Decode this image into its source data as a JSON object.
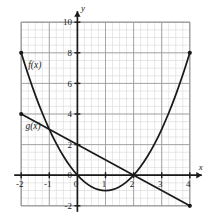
{
  "chart_data": {
    "type": "line",
    "title": "",
    "xlabel": "x",
    "ylabel": "y",
    "xlim": [
      -2,
      4
    ],
    "ylim": [
      -2,
      10
    ],
    "grid": true,
    "grid_minor_x_step": 0.25,
    "grid_minor_y_step": 0.5,
    "x_ticks": [
      -2,
      -1,
      0,
      1,
      2,
      3,
      4
    ],
    "x_tick_labels": [
      "-2",
      "-1",
      "0",
      "1",
      "2",
      "3",
      "4"
    ],
    "y_ticks": [
      -2,
      0,
      2,
      4,
      6,
      8,
      10
    ],
    "y_tick_labels": [
      "-2",
      "0",
      "2",
      "4",
      "6",
      "8",
      "10"
    ],
    "legend_position": "inline-annotation",
    "series": [
      {
        "name": "f(x)",
        "label": "f(x)",
        "equation": "x^2 - 2x",
        "shape": "parabola",
        "color": "#1a1a1a",
        "vertex": [
          1,
          -1
        ],
        "endpoints": [
          [
            -2,
            8
          ],
          [
            4,
            8
          ]
        ],
        "endpoint_markers": true,
        "label_position": [
          -1.75,
          7.0
        ],
        "points": [
          [
            -2,
            8
          ],
          [
            -1.75,
            6.5625
          ],
          [
            -1.5,
            5.25
          ],
          [
            -1.25,
            4.0625
          ],
          [
            -1,
            3
          ],
          [
            -0.75,
            2.0625
          ],
          [
            -0.5,
            1.25
          ],
          [
            -0.25,
            0.5625
          ],
          [
            0,
            0
          ],
          [
            0.25,
            -0.4375
          ],
          [
            0.5,
            -0.75
          ],
          [
            0.75,
            -0.9375
          ],
          [
            1,
            -1
          ],
          [
            1.25,
            -0.9375
          ],
          [
            1.5,
            -0.75
          ],
          [
            1.75,
            -0.4375
          ],
          [
            2,
            0
          ],
          [
            2.25,
            0.5625
          ],
          [
            2.5,
            1.25
          ],
          [
            2.75,
            2.0625
          ],
          [
            3,
            3
          ],
          [
            3.25,
            4.0625
          ],
          [
            3.5,
            5.25
          ],
          [
            3.75,
            6.5625
          ],
          [
            4,
            8
          ]
        ]
      },
      {
        "name": "g(x)",
        "label": "g(x)",
        "equation": "-x + 2",
        "shape": "line",
        "color": "#1a1a1a",
        "slope": -1,
        "y_intercept": 2,
        "endpoints": [
          [
            -2,
            4
          ],
          [
            4,
            -2
          ]
        ],
        "endpoint_markers": true,
        "label_position": [
          -1.85,
          3.05
        ],
        "points": [
          [
            -2,
            4
          ],
          [
            4,
            -2
          ]
        ]
      }
    ],
    "intersections": [
      [
        2,
        0
      ]
    ],
    "annotations": [
      {
        "text": "f(x)",
        "x": -1.75,
        "y": 7.0
      },
      {
        "text": "g(x)",
        "x": -1.85,
        "y": 3.05
      },
      {
        "text": "x",
        "x": 4.35,
        "y": 0.75
      },
      {
        "text": "y",
        "x": 0.28,
        "y": 10.7
      }
    ]
  },
  "colors": {
    "curve": "#1a1a1a",
    "axis": "#1a1a1a",
    "grid_major": "#9a9a9a",
    "grid_minor": "#d6d6d6",
    "background": "#ffffff",
    "plot_border": "#9a9a9a"
  },
  "axis_labels": {
    "x": "x",
    "y": "y"
  }
}
